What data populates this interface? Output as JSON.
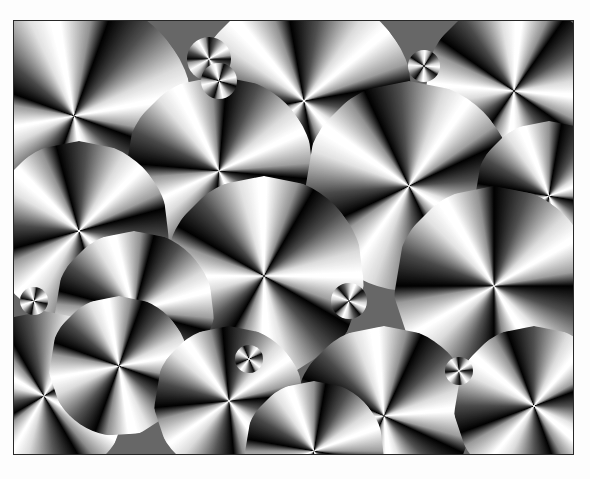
{
  "image": {
    "description": "Grayscale polarized optical micrograph of spherulites showing Maltese-cross extinction patterns",
    "frame": {
      "x": 13,
      "y": 20,
      "width": 559,
      "height": 433
    },
    "border_color": "#333333",
    "background_color": "#fdfdfd",
    "spherulites": [
      {
        "x": 60,
        "y": 95,
        "r": 120,
        "rot": 20
      },
      {
        "x": 290,
        "y": 80,
        "r": 110,
        "rot": -10
      },
      {
        "x": 500,
        "y": 70,
        "r": 90,
        "rot": 35
      },
      {
        "x": 205,
        "y": 150,
        "r": 95,
        "rot": 5
      },
      {
        "x": 395,
        "y": 165,
        "r": 105,
        "rot": -25
      },
      {
        "x": 535,
        "y": 175,
        "r": 75,
        "rot": 10
      },
      {
        "x": 65,
        "y": 210,
        "r": 90,
        "rot": -15
      },
      {
        "x": 250,
        "y": 255,
        "r": 100,
        "rot": 30
      },
      {
        "x": 480,
        "y": 265,
        "r": 100,
        "rot": 0
      },
      {
        "x": 120,
        "y": 290,
        "r": 80,
        "rot": 15
      },
      {
        "x": 30,
        "y": 375,
        "r": 85,
        "rot": -30
      },
      {
        "x": 105,
        "y": 345,
        "r": 70,
        "rot": 20
      },
      {
        "x": 215,
        "y": 380,
        "r": 75,
        "rot": -5
      },
      {
        "x": 370,
        "y": 395,
        "r": 90,
        "rot": 25
      },
      {
        "x": 520,
        "y": 385,
        "r": 80,
        "rot": -20
      },
      {
        "x": 300,
        "y": 430,
        "r": 70,
        "rot": 10
      }
    ],
    "small_clusters": [
      {
        "x": 195,
        "y": 38,
        "r": 22
      },
      {
        "x": 205,
        "y": 60,
        "r": 18
      },
      {
        "x": 410,
        "y": 45,
        "r": 16
      },
      {
        "x": 335,
        "y": 280,
        "r": 18
      },
      {
        "x": 235,
        "y": 338,
        "r": 14
      },
      {
        "x": 445,
        "y": 350,
        "r": 14
      },
      {
        "x": 20,
        "y": 280,
        "r": 14
      }
    ]
  }
}
